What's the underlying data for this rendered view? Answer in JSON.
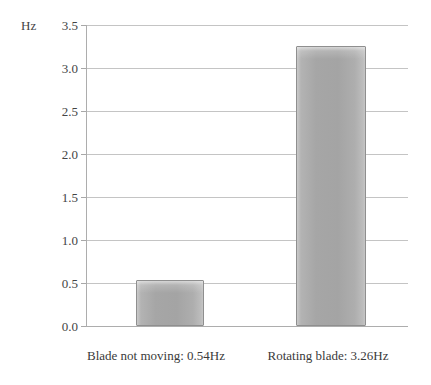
{
  "chart_data": {
    "type": "bar",
    "title": "",
    "subtitle": "",
    "xlabel": "",
    "ylabel": "Hz",
    "unit_label": "Hz",
    "categories": [
      "Blade not moving: 0.54Hz",
      "Rotating blade: 3.26Hz"
    ],
    "values": [
      0.54,
      3.26
    ],
    "ylim": [
      0.0,
      3.5
    ],
    "ytick_labels": [
      "0.0",
      "0.5",
      "1.0",
      "1.5",
      "2.0",
      "2.5",
      "3.0",
      "3.5"
    ],
    "ytick_values": [
      0.0,
      0.5,
      1.0,
      1.5,
      2.0,
      2.5,
      3.0,
      3.5
    ],
    "grid": true,
    "legend": false,
    "legend_position": "none",
    "series": [
      {
        "name": "Frequency",
        "values": [
          0.54,
          3.26
        ]
      }
    ],
    "colors": {
      "bar_fill_light": "#c9c9c9",
      "bar_fill_mid": "#a6a6a6",
      "bar_border": "#8f8f8f",
      "gridline": "#c4c4c4",
      "axis": "#adadad",
      "text": "#3a3a3a",
      "background": "#ffffff"
    }
  }
}
